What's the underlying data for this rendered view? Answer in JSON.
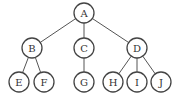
{
  "diagram": {
    "type": "tree",
    "nodes": [
      {
        "id": "A",
        "label": "A",
        "x": 84,
        "y": 13
      },
      {
        "id": "B",
        "label": "B",
        "x": 32,
        "y": 48
      },
      {
        "id": "C",
        "label": "C",
        "x": 84,
        "y": 48
      },
      {
        "id": "D",
        "label": "D",
        "x": 137,
        "y": 48
      },
      {
        "id": "E",
        "label": "E",
        "x": 19,
        "y": 82
      },
      {
        "id": "F",
        "label": "F",
        "x": 44,
        "y": 82
      },
      {
        "id": "G",
        "label": "G",
        "x": 84,
        "y": 82
      },
      {
        "id": "H",
        "label": "H",
        "x": 113,
        "y": 82
      },
      {
        "id": "I",
        "label": "I",
        "x": 137,
        "y": 82
      },
      {
        "id": "J",
        "label": "J",
        "x": 161,
        "y": 82
      }
    ],
    "edges": [
      [
        "A",
        "B"
      ],
      [
        "A",
        "C"
      ],
      [
        "A",
        "D"
      ],
      [
        "B",
        "E"
      ],
      [
        "B",
        "F"
      ],
      [
        "C",
        "G"
      ],
      [
        "D",
        "H"
      ],
      [
        "D",
        "I"
      ],
      [
        "D",
        "J"
      ]
    ],
    "node_radius": 10
  }
}
